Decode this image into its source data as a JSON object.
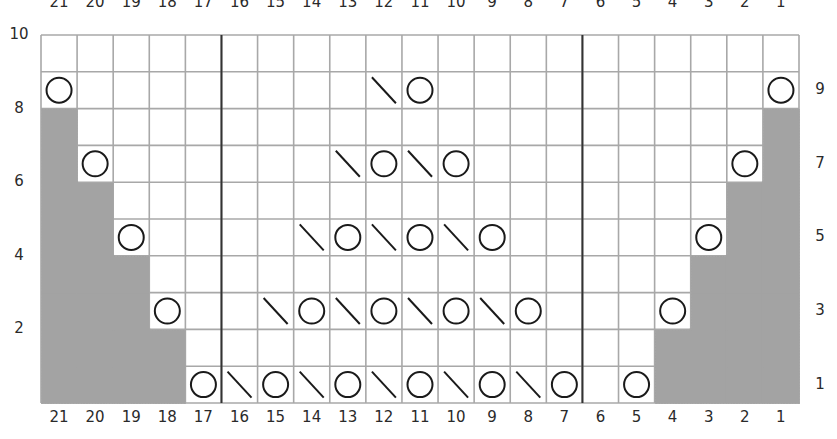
{
  "chart_data": {
    "type": "knitting-chart",
    "columns": 21,
    "rows": 10,
    "column_labels_top": [
      "21",
      "20",
      "19",
      "18",
      "17",
      "16",
      "15",
      "14",
      "13",
      "12",
      "11",
      "10",
      "9",
      "8",
      "7",
      "6",
      "5",
      "4",
      "3",
      "2",
      "1"
    ],
    "column_labels_bottom": [
      "21",
      "20",
      "19",
      "18",
      "17",
      "16",
      "15",
      "14",
      "13",
      "12",
      "11",
      "10",
      "9",
      "8",
      "7",
      "6",
      "5",
      "4",
      "3",
      "2",
      "1"
    ],
    "row_labels_left": [
      "10",
      "8",
      "6",
      "4",
      "2"
    ],
    "row_labels_right": [
      "9",
      "7",
      "5",
      "3",
      "1"
    ],
    "repeat_boundaries_between_columns": [
      [
        17,
        16
      ],
      [
        7,
        6
      ]
    ],
    "symbols": {
      "O": "yarn-over",
      "\\": "ssk-decrease",
      "shaded": "no-stitch"
    },
    "grid": {
      "10": [],
      "9": [
        {
          "col": 21,
          "sym": "O"
        },
        {
          "col": 12,
          "sym": "\\"
        },
        {
          "col": 11,
          "sym": "O"
        },
        {
          "col": 1,
          "sym": "O"
        }
      ],
      "8": [],
      "7": [
        {
          "col": 20,
          "sym": "O"
        },
        {
          "col": 13,
          "sym": "\\"
        },
        {
          "col": 12,
          "sym": "O"
        },
        {
          "col": 11,
          "sym": "\\"
        },
        {
          "col": 10,
          "sym": "O"
        },
        {
          "col": 2,
          "sym": "O"
        }
      ],
      "6": [],
      "5": [
        {
          "col": 19,
          "sym": "O"
        },
        {
          "col": 14,
          "sym": "\\"
        },
        {
          "col": 13,
          "sym": "O"
        },
        {
          "col": 12,
          "sym": "\\"
        },
        {
          "col": 11,
          "sym": "O"
        },
        {
          "col": 10,
          "sym": "\\"
        },
        {
          "col": 9,
          "sym": "O"
        },
        {
          "col": 3,
          "sym": "O"
        }
      ],
      "4": [],
      "3": [
        {
          "col": 18,
          "sym": "O"
        },
        {
          "col": 15,
          "sym": "\\"
        },
        {
          "col": 14,
          "sym": "O"
        },
        {
          "col": 13,
          "sym": "\\"
        },
        {
          "col": 12,
          "sym": "O"
        },
        {
          "col": 11,
          "sym": "\\"
        },
        {
          "col": 10,
          "sym": "O"
        },
        {
          "col": 9,
          "sym": "\\"
        },
        {
          "col": 8,
          "sym": "O"
        },
        {
          "col": 4,
          "sym": "O"
        }
      ],
      "2": [],
      "1": [
        {
          "col": 17,
          "sym": "O"
        },
        {
          "col": 16,
          "sym": "\\"
        },
        {
          "col": 15,
          "sym": "O"
        },
        {
          "col": 14,
          "sym": "\\"
        },
        {
          "col": 13,
          "sym": "O"
        },
        {
          "col": 12,
          "sym": "\\"
        },
        {
          "col": 11,
          "sym": "O"
        },
        {
          "col": 10,
          "sym": "\\"
        },
        {
          "col": 9,
          "sym": "O"
        },
        {
          "col": 8,
          "sym": "\\"
        },
        {
          "col": 7,
          "sym": "O"
        },
        {
          "col": 5,
          "sym": "O"
        }
      ]
    },
    "shaded": {
      "10": [],
      "9": [],
      "8": [
        21,
        1
      ],
      "7": [
        21,
        1
      ],
      "6": [
        21,
        20,
        2,
        1
      ],
      "5": [
        21,
        20,
        2,
        1
      ],
      "4": [
        21,
        20,
        19,
        3,
        2,
        1
      ],
      "3": [
        21,
        20,
        19,
        3,
        2,
        1
      ],
      "2": [
        21,
        20,
        19,
        18,
        4,
        3,
        2,
        1
      ],
      "1": [
        21,
        20,
        19,
        18,
        4,
        3,
        2,
        1
      ]
    }
  },
  "colors": {
    "grid_line": "#a8a8a8",
    "boundary_line": "#333333",
    "shade": "#a3a3a3",
    "symbol": "#1a1a1a"
  }
}
